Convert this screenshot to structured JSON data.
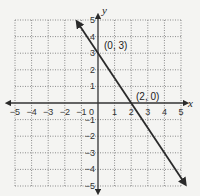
{
  "chart_data": {
    "type": "line",
    "title": "",
    "xlabel": "x",
    "ylabel": "y",
    "xlim": [
      -5,
      5
    ],
    "ylim": [
      -5,
      5
    ],
    "grid": true,
    "x_ticks": [
      -5,
      -4,
      -3,
      -2,
      -1,
      0,
      1,
      2,
      3,
      4,
      5
    ],
    "y_ticks": [
      -5,
      -4,
      -3,
      -2,
      -1,
      1,
      2,
      3,
      4,
      5
    ],
    "series": [
      {
        "name": "line",
        "equation": "y = -1.5x + 3",
        "x": [
          -1.2,
          5.2
        ],
        "y": [
          4.8,
          -4.8
        ]
      }
    ],
    "points": [
      {
        "x": 0,
        "y": 3,
        "label": "(0, 3)"
      },
      {
        "x": 2,
        "y": 0,
        "label": "(2, 0)"
      }
    ]
  },
  "labels": {
    "x_axis": "x",
    "y_axis": "y",
    "origin": "0",
    "point_a": "(0, 3)",
    "point_b": "(2, 0)"
  },
  "colors": {
    "line": "#2a2a2a",
    "grid": "#8a8a8a",
    "axis": "#333333",
    "background": "#f4f4f2"
  }
}
